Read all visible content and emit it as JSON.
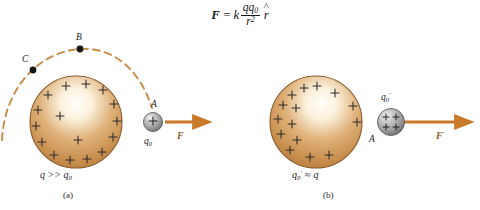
{
  "figure": {
    "equation": {
      "lhs": "F",
      "equals": "=",
      "k": "k",
      "numerator": "qq",
      "numerator_sub": "0",
      "denominator": "r",
      "denominator_exp": "2",
      "unit_vector": "r",
      "unit_vector_hat": "^",
      "plain": "F = k qq0 / r^2  r-hat"
    },
    "panels": [
      {
        "id": "a",
        "caption": "(a)",
        "condition_label": "q >> q",
        "condition_sub": "0",
        "condition_plain": "q >> q0",
        "source_charge": {
          "name": "large positive conductor sphere",
          "sign": "+",
          "charge_count": 16,
          "charge_distribution": "uniform around perimeter"
        },
        "test_charge": {
          "label": "q",
          "label_sub": "0",
          "label_plain": "q0",
          "point_label": "A",
          "sign": "+",
          "sign_count": 1,
          "size": "small"
        },
        "force": {
          "label": "F",
          "direction": "right",
          "magnitude_hint": "short"
        },
        "path_points": [
          {
            "label": "C"
          },
          {
            "label": "B"
          },
          {
            "label": "A"
          }
        ],
        "path": {
          "style": "dashed arc",
          "color": "#C98A45"
        }
      },
      {
        "id": "b",
        "caption": "(b)",
        "condition_label": "q",
        "condition_sub": "0",
        "condition_prime": "'",
        "condition_rel": "≈",
        "condition_rhs": "q",
        "condition_plain": "q0' ≈ q",
        "source_charge": {
          "name": "large positive conductor sphere",
          "sign": "+",
          "charge_count": 15,
          "charge_distribution": "crowded toward left side"
        },
        "test_charge": {
          "label": "q",
          "label_sub": "0",
          "label_prime": "'",
          "label_plain": "q0'",
          "point_label": "A",
          "sign": "+",
          "sign_count": 4,
          "size": "large"
        },
        "force": {
          "label": "F",
          "label_prime": "'",
          "label_plain": "F'",
          "direction": "right",
          "magnitude_hint": "long"
        }
      }
    ]
  },
  "colors": {
    "sphere_edge": "#8B5A2B",
    "sphere_fill_outer": "#C08442",
    "sphere_fill_inner": "#FFFDF5",
    "arrow": "#C87A2A",
    "arc": "#C98A45",
    "point": "#141414",
    "test_sphere_edge": "#4a4a4a",
    "test_sphere_fill": "#b9b9b9",
    "text": "#1a1a1a"
  }
}
